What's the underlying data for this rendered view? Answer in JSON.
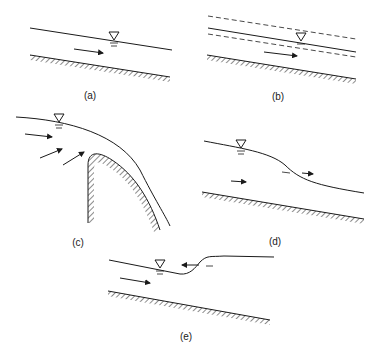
{
  "diagram": {
    "panels": [
      {
        "id": "a",
        "label": "(a)",
        "description": "uniform flow, free surface parallel to bed"
      },
      {
        "id": "b",
        "label": "(b)",
        "description": "unsteady uniform flow, surface oscillating between dashed limits"
      },
      {
        "id": "c",
        "label": "(c)",
        "description": "rapidly varied flow over spillway crest"
      },
      {
        "id": "d",
        "label": "(d)",
        "description": "gradually/rapidly varied flow, surface drop"
      },
      {
        "id": "e",
        "label": "(e)",
        "description": "surge / moving hydraulic jump traveling upstream"
      }
    ],
    "colors": {
      "line": "#1a1a1a",
      "background": "#ffffff"
    }
  }
}
